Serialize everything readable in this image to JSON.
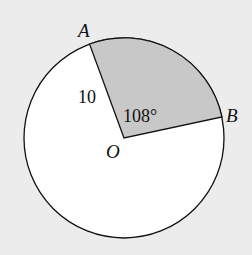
{
  "diagram": {
    "type": "circle-sector",
    "center": {
      "label": "O",
      "x": 124,
      "y": 138
    },
    "radius_px": 100,
    "points": [
      {
        "label": "A",
        "x": 89,
        "y": 44
      },
      {
        "label": "B",
        "x": 222,
        "y": 116
      }
    ],
    "radius_label": "10",
    "angle_label": "108°",
    "colors": {
      "background": "#ececec",
      "circle_fill": "#ffffff",
      "sector_fill": "#c8c8c8",
      "stroke": "#111111"
    }
  }
}
